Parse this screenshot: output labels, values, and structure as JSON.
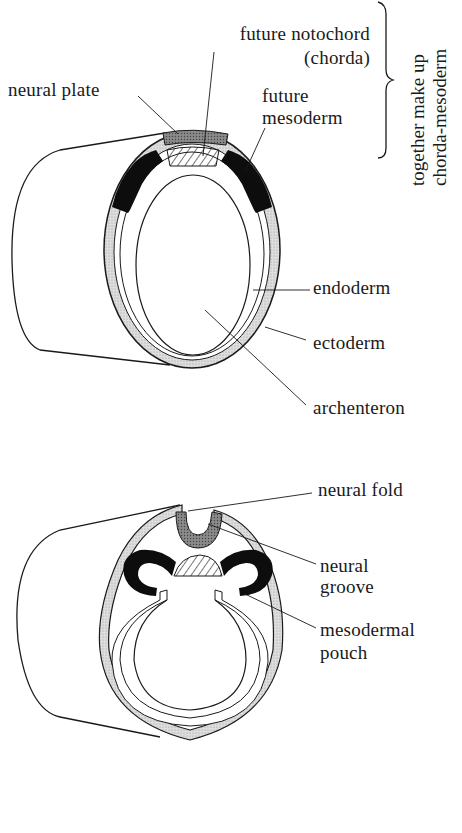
{
  "figure": {
    "top_diagram": {
      "labels": {
        "notochord_line1": "future notochord",
        "notochord_line2": "(chorda)",
        "neural_plate": "neural plate",
        "mesoderm_line1": "future",
        "mesoderm_line2": "mesoderm",
        "endoderm": "endoderm",
        "ectoderm": "ectoderm",
        "archenteron": "archenteron"
      },
      "brace_note": {
        "line1": "together make up",
        "line2": "chorda-mesoderm"
      }
    },
    "bottom_diagram": {
      "labels": {
        "neural_fold": "neural fold",
        "neural_groove_line1": "neural",
        "neural_groove_line2": "groove",
        "mesodermal_pouch_line1": "mesodermal",
        "mesodermal_pouch_line2": "pouch"
      }
    },
    "colors": {
      "ink": "#1a1a1a",
      "ectoderm_fill": "#d9d9d9",
      "neural_fill": "#8a8a8a",
      "mesoderm_fill": "#0d0d0d",
      "background": "#ffffff"
    }
  }
}
